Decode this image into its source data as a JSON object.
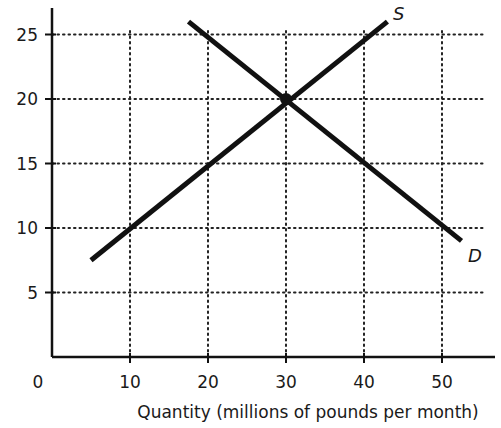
{
  "chart_data": {
    "type": "line",
    "title": "",
    "xlabel": "Quantity (millions of pounds per month)",
    "ylabel": "",
    "xlim": [
      0,
      55
    ],
    "ylim": [
      0,
      27
    ],
    "x_ticks": [
      10,
      20,
      30,
      40,
      50
    ],
    "y_ticks": [
      5,
      10,
      15,
      20,
      25
    ],
    "origin_label": "0",
    "grid": true,
    "grid_style": "dotted",
    "legend": "none",
    "series": [
      {
        "name": "S",
        "label": "S",
        "points": [
          [
            5,
            7.5
          ],
          [
            43,
            26
          ]
        ]
      },
      {
        "name": "D",
        "label": "D",
        "points": [
          [
            17.5,
            26
          ],
          [
            52.5,
            9
          ]
        ]
      }
    ],
    "annotations": [
      {
        "type": "point",
        "x": 30,
        "y": 20,
        "label": "equilibrium"
      }
    ]
  },
  "labels": {
    "x_title": "Quantity (millions of pounds per month)",
    "origin": "0",
    "x_ticks": [
      "10",
      "20",
      "30",
      "40",
      "50"
    ],
    "y_ticks": [
      "5",
      "10",
      "15",
      "20",
      "25"
    ],
    "supply": "S",
    "demand": "D"
  },
  "colors": {
    "line": "#111111",
    "grid": "#222222",
    "background": "#ffffff"
  }
}
